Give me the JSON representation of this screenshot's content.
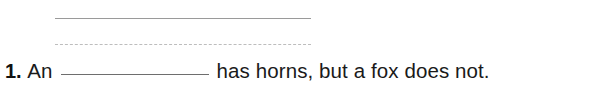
{
  "worksheet": {
    "guide_lines": {
      "solid_line_color": "#9a9a9a",
      "dashed_line_color": "#bdbdbd"
    },
    "question": {
      "number": "1.",
      "lead_text": "An",
      "blank_value": "",
      "blank_placeholder": "",
      "tail_text": "has horns, but a fox does not.",
      "blank_rule_color": "#6e6e6e",
      "text_color": "#1a1a1a"
    }
  }
}
